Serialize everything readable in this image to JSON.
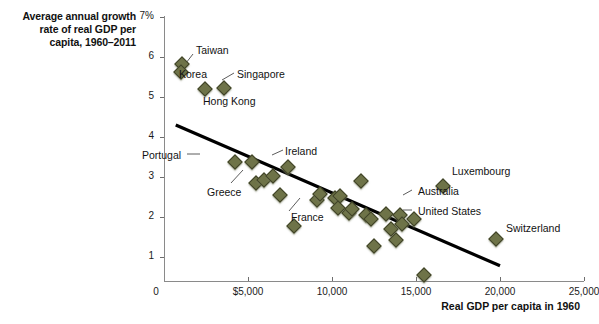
{
  "chart_data": {
    "type": "scatter",
    "title": "",
    "ylabel": "Average annual growth rate of real GDP per capita, 1960–2011",
    "xlabel": "Real GDP per capita in 1960",
    "xlim": [
      0,
      25000
    ],
    "ylim": [
      0,
      7
    ],
    "xticks": [
      0,
      5000,
      10000,
      15000,
      20000,
      25000
    ],
    "xtick_labels": [
      "0",
      "$5,000",
      "10,000",
      "15,000",
      "20,000",
      "25,000"
    ],
    "yticks": [
      1,
      2,
      3,
      4,
      5,
      6,
      7
    ],
    "ytick_labels": [
      "1",
      "2",
      "3",
      "4",
      "5",
      "6",
      "7%"
    ],
    "grid": false,
    "legend": false,
    "marker_color": "#6e7348",
    "marker_edge_color": "#3f4227",
    "trendline": {
      "color": "#000000",
      "x_start": 700,
      "y_start": 4.3,
      "x_end": 20000,
      "y_end": 0.78
    },
    "points": [
      {
        "label": "Taiwan",
        "x": 1050,
        "y": 5.82
      },
      {
        "label": "Korea",
        "x": 1000,
        "y": 5.62
      },
      {
        "label": "Hong Kong",
        "x": 2450,
        "y": 5.2
      },
      {
        "label": "Singapore",
        "x": 3550,
        "y": 5.22
      },
      {
        "label": "Portugal",
        "x": 4200,
        "y": 3.38
      },
      {
        "label": "",
        "x": 5250,
        "y": 3.38
      },
      {
        "label": "Greece",
        "x": 5450,
        "y": 2.85
      },
      {
        "label": "",
        "x": 5950,
        "y": 2.93
      },
      {
        "label": "",
        "x": 6500,
        "y": 3.02
      },
      {
        "label": "",
        "x": 6900,
        "y": 2.55
      },
      {
        "label": "Ireland",
        "x": 7400,
        "y": 3.25
      },
      {
        "label": "France",
        "x": 7750,
        "y": 1.78
      },
      {
        "label": "",
        "x": 9100,
        "y": 2.42
      },
      {
        "label": "",
        "x": 9300,
        "y": 2.58
      },
      {
        "label": "",
        "x": 10150,
        "y": 2.48
      },
      {
        "label": "",
        "x": 10450,
        "y": 2.52
      },
      {
        "label": "",
        "x": 10350,
        "y": 2.22
      },
      {
        "label": "",
        "x": 11000,
        "y": 2.1
      },
      {
        "label": "",
        "x": 11200,
        "y": 2.2
      },
      {
        "label": "",
        "x": 11700,
        "y": 2.9
      },
      {
        "label": "",
        "x": 12000,
        "y": 2.05
      },
      {
        "label": "",
        "x": 12300,
        "y": 1.95
      },
      {
        "label": "",
        "x": 12500,
        "y": 1.28
      },
      {
        "label": "",
        "x": 13200,
        "y": 2.08
      },
      {
        "label": "",
        "x": 13500,
        "y": 1.7
      },
      {
        "label": "",
        "x": 13800,
        "y": 1.42
      },
      {
        "label": "Australia",
        "x": 14050,
        "y": 2.05
      },
      {
        "label": "United States",
        "x": 14150,
        "y": 1.82
      },
      {
        "label": "",
        "x": 14900,
        "y": 1.95
      },
      {
        "label": "Luxembourg",
        "x": 16600,
        "y": 2.78
      },
      {
        "label": "",
        "x": 15450,
        "y": 0.55
      },
      {
        "label": "Switzerland",
        "x": 19750,
        "y": 1.45
      }
    ],
    "annotations": [
      "Taiwan",
      "Korea",
      "Singapore",
      "Hong Kong",
      "Portugal",
      "Greece",
      "Ireland",
      "France",
      "Australia",
      "United States",
      "Luxembourg",
      "Switzerland"
    ]
  },
  "labels": {
    "taiwan": "Taiwan",
    "korea": "Korea",
    "singapore": "Singapore",
    "hong_kong": "Hong Kong",
    "portugal": "Portugal",
    "greece": "Greece",
    "ireland": "Ireland",
    "france": "France",
    "australia": "Australia",
    "united_states": "United States",
    "luxembourg": "Luxembourg",
    "switzerland": "Switzerland"
  },
  "axes": {
    "y_title": "Average annual growth\nrate of real GDP per\ncapita, 1960–2011",
    "x_title": "Real GDP per capita in 1960",
    "y_labels": [
      "7%",
      "6",
      "5",
      "4",
      "3",
      "2",
      "1"
    ],
    "x_labels": [
      "0",
      "$5,000",
      "10,000",
      "15,000",
      "20,000",
      "25,000"
    ]
  }
}
